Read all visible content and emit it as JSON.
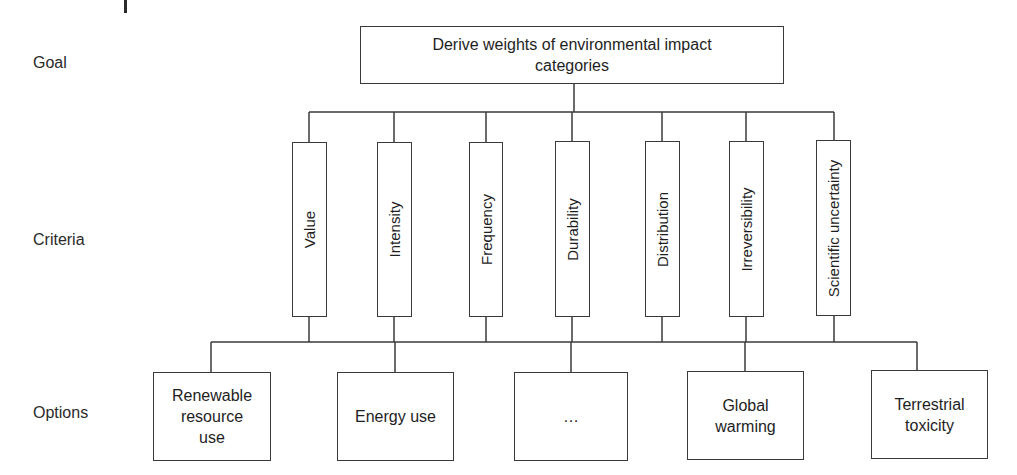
{
  "diagram": {
    "type": "hierarchy",
    "row_labels": {
      "goal": "Goal",
      "criteria": "Criteria",
      "options": "Options"
    },
    "goal": {
      "label": "Derive weights of environmental impact categories",
      "line1": "Derive weights of environmental impact",
      "line2": "categories"
    },
    "criteria": [
      {
        "label": "Value"
      },
      {
        "label": "Intensity"
      },
      {
        "label": "Frequency"
      },
      {
        "label": "Durability"
      },
      {
        "label": "Distribution"
      },
      {
        "label": "Irreversibility"
      },
      {
        "label": "Scientific uncertainty"
      }
    ],
    "options": [
      {
        "label": "Renewable resource use",
        "lines": [
          "Renewable",
          "resource",
          "use"
        ]
      },
      {
        "label": "Energy use",
        "lines": [
          "Energy use"
        ]
      },
      {
        "label": "...",
        "lines": [
          "…"
        ]
      },
      {
        "label": "Global warming",
        "lines": [
          "Global",
          "warming"
        ]
      },
      {
        "label": "Terrestrial toxicity",
        "lines": [
          "Terrestrial",
          "toxicity"
        ]
      }
    ],
    "colors": {
      "line": "#3a3a3a",
      "text": "#1e1e1e",
      "background": "#ffffff"
    }
  }
}
